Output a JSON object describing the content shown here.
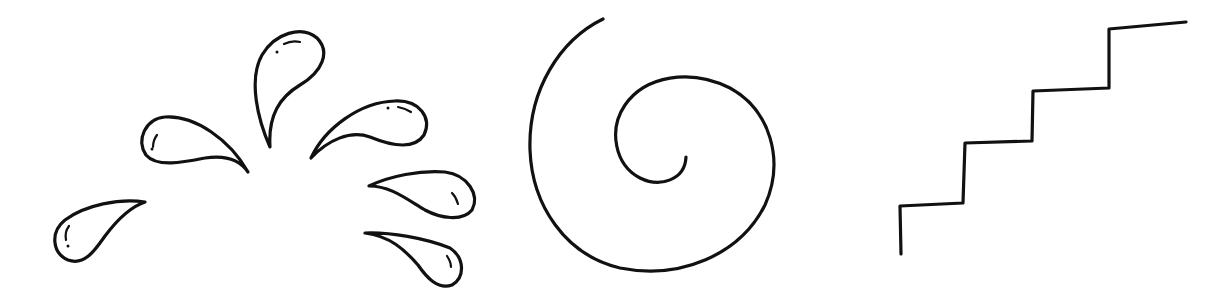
{
  "canvas": {
    "width": 1229,
    "height": 303,
    "background": "#ffffff",
    "ink": "#111111"
  },
  "drawings": [
    {
      "id": "splash",
      "label": "water splash droplets",
      "droplet_count": 6
    },
    {
      "id": "spiral",
      "label": "spiral"
    },
    {
      "id": "stairs",
      "label": "staircase",
      "step_count": 4
    }
  ]
}
